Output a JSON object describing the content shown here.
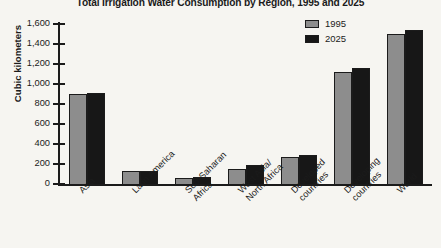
{
  "chart_data": {
    "type": "bar",
    "title": "Total Irrigation Water Consumption by Region, 1995 and 2025",
    "xlabel": "",
    "ylabel": "Cubic kilometers",
    "ylim": [
      0,
      1600
    ],
    "ytick_step": 200,
    "grid": false,
    "legend_position": "top-right",
    "categories": [
      "Asia",
      "Latin America",
      "Sub-Saharan Africa",
      "West Asia/North Africa",
      "Developed countries",
      "Developing countries",
      "World"
    ],
    "ytick_labels": [
      "1,600",
      "1,400",
      "1,200",
      "1,000",
      "800",
      "600",
      "400",
      "200",
      "0"
    ],
    "ytick_values": [
      1600,
      1400,
      1200,
      1000,
      800,
      600,
      400,
      200,
      0
    ],
    "series": [
      {
        "name": "1995",
        "color": "#8d8d8d",
        "values": [
          900,
          130,
          65,
          150,
          270,
          1120,
          1500
        ]
      },
      {
        "name": "2025",
        "color": "#171717",
        "values": [
          910,
          135,
          75,
          190,
          290,
          1165,
          1540
        ]
      }
    ]
  },
  "legend": {
    "items": [
      {
        "label": "1995",
        "swatch_class": "s1995"
      },
      {
        "label": "2025",
        "swatch_class": "s2025"
      }
    ]
  },
  "colors": {
    "series_1995": "#8d8d8d",
    "series_2025": "#171717",
    "axis": "#1b1b1b",
    "background": "#f6f5f1"
  }
}
